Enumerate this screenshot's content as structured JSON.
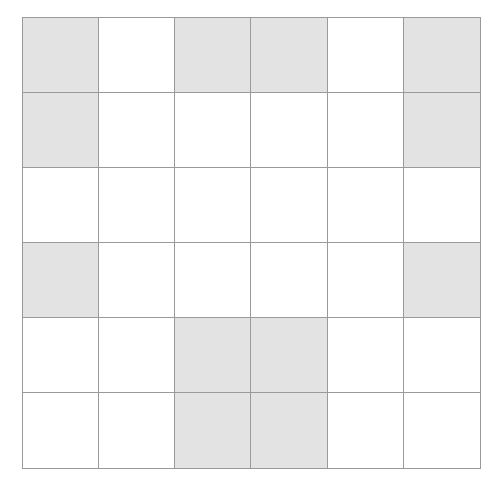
{
  "grid": {
    "rows": 6,
    "cols": 6,
    "shaded_color": "#e3e3e3",
    "empty_color": "#ffffff",
    "line_color": "#9a9a9a",
    "cells": [
      [
        1,
        0,
        1,
        1,
        0,
        1
      ],
      [
        1,
        0,
        0,
        0,
        0,
        1
      ],
      [
        0,
        0,
        0,
        0,
        0,
        0
      ],
      [
        1,
        0,
        0,
        0,
        0,
        1
      ],
      [
        0,
        0,
        1,
        1,
        0,
        0
      ],
      [
        0,
        0,
        1,
        1,
        0,
        0
      ]
    ]
  }
}
